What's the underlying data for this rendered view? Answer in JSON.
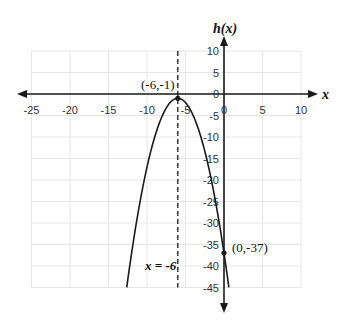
{
  "chart_data": {
    "type": "line",
    "title": "",
    "xlabel": "x",
    "ylabel": "h(x)",
    "xlim": [
      -25,
      10
    ],
    "ylim": [
      -45,
      10
    ],
    "grid": true,
    "x_ticks": [
      -25,
      -20,
      -15,
      -10,
      -5,
      0,
      5,
      10
    ],
    "y_ticks": [
      10,
      5,
      0,
      -5,
      -10,
      -15,
      -20,
      -25,
      -30,
      -35,
      -40,
      -45
    ],
    "x_tick_labels": [
      "-25",
      "-20",
      "-15",
      "-10",
      "-5",
      "0",
      "5",
      "10"
    ],
    "y_tick_labels": [
      "10",
      "5",
      "0",
      "-5",
      "-10",
      "-15",
      "-20",
      "-25",
      "-30",
      "-35",
      "-40",
      "-45"
    ],
    "series": [
      {
        "name": "h(x) = -(x+6)^2 - 1",
        "x": [
          -12.63,
          -12,
          -11,
          -10,
          -9,
          -8,
          -7,
          -6,
          -5,
          -4,
          -3,
          -2,
          -1,
          0,
          0.63
        ],
        "values": [
          -45,
          -37,
          -26,
          -17,
          -10,
          -5,
          -2,
          -1,
          -2,
          -5,
          -10,
          -17,
          -26,
          -37,
          -45
        ]
      }
    ],
    "annotations": [
      {
        "type": "point",
        "x": -6,
        "y": -1,
        "label": "(-6,-1)"
      },
      {
        "type": "point",
        "x": 0,
        "y": -37,
        "label": "(0,-37)"
      },
      {
        "type": "vertical-dashed-line",
        "x": -6,
        "label": "x = -6"
      }
    ]
  },
  "labels": {
    "x_axis": "x",
    "y_axis": "h(x)",
    "vertex": "(-6,-1)",
    "y_intercept": "(0,-37)",
    "axis_of_symmetry": "x = -6"
  },
  "colors": {
    "curve": "#1a1a1a",
    "axis": "#1a1a1a",
    "grid": "#e6e6e6",
    "tick_text": "#333333"
  }
}
